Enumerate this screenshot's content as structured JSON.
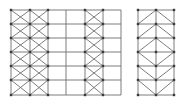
{
  "diagram": {
    "type": "structural-frame-bracing",
    "colors": {
      "line": "#6e6e6e",
      "node": "#3a3a3a",
      "background": "#ffffff"
    },
    "rows_y": [
      10,
      24,
      38,
      52,
      66,
      80,
      95
    ],
    "frames": [
      {
        "name": "left-frame",
        "columns_x": [
          11,
          30,
          48,
          66,
          85,
          103,
          121
        ],
        "bracing": [
          {
            "bay": 0,
            "pattern": "X-spanning-two-rows-offset"
          },
          {
            "bay": 1,
            "pattern": "X-spanning-two-rows-offset"
          },
          {
            "bay": 4,
            "pattern": "X-per-row"
          }
        ]
      },
      {
        "name": "right-frame",
        "columns_x": [
          138,
          156,
          174
        ],
        "bracing": [
          {
            "bay": "all",
            "pattern": "chevron-and-diamond"
          }
        ]
      }
    ]
  }
}
